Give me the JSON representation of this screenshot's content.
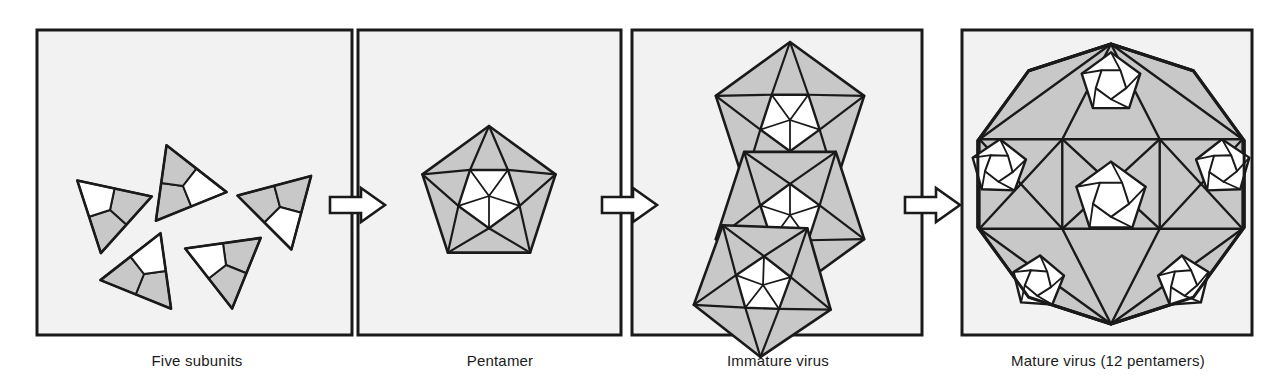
{
  "figure": {
    "background_color": "#ffffff",
    "panel_fill": "#f2f2f2",
    "panel_stroke": "#1a1a1a",
    "shape_fill": "#c8c8c8",
    "shape_white": "#ffffff",
    "shape_stroke": "#1a1a1a",
    "arrow_fill": "#ffffff",
    "arrow_stroke": "#1a1a1a"
  },
  "panels": [
    {
      "id": "five-subunits",
      "label": "Five subunits",
      "label_x": 197,
      "label_y": 352,
      "box": {
        "x": 37,
        "y": 30,
        "w": 315,
        "h": 305
      },
      "content_kind": "scattered-subunits",
      "subunit_count": 5,
      "subunits": [
        {
          "cx": 110,
          "cy": 210,
          "r": 44,
          "rot": -18
        },
        {
          "cx": 183,
          "cy": 186,
          "r": 44,
          "rot": 128
        },
        {
          "cx": 144,
          "cy": 274,
          "r": 44,
          "rot": 52
        },
        {
          "cx": 226,
          "cy": 265,
          "r": 44,
          "rot": -38
        },
        {
          "cx": 280,
          "cy": 207,
          "r": 44,
          "rot": 195
        }
      ]
    },
    {
      "id": "pentamer",
      "label": "Pentamer",
      "label_x": 500,
      "label_y": 352,
      "box": {
        "x": 358,
        "y": 30,
        "w": 263,
        "h": 305
      },
      "content_kind": "single-pentamer",
      "pentamer": {
        "cx": 489,
        "cy": 196,
        "r": 70,
        "rot": -90
      }
    },
    {
      "id": "immature-virus",
      "label": "Immature virus",
      "label_x": 778,
      "label_y": 352,
      "box": {
        "x": 632,
        "y": 30,
        "w": 290,
        "h": 305
      },
      "content_kind": "partial-assembly",
      "pentamer_count": 3,
      "pentamers": [
        {
          "cx": 790,
          "cy": 120,
          "r": 78,
          "rot": -90
        },
        {
          "cx": 790,
          "cy": 215,
          "r": 78,
          "rot": 90
        },
        {
          "cx": 763,
          "cy": 285,
          "r": 72,
          "rot": 20
        }
      ]
    },
    {
      "id": "mature-virus",
      "label": "Mature virus (12 pentamers)",
      "label_x": 1108,
      "label_y": 352,
      "box": {
        "x": 962,
        "y": 30,
        "w": 290,
        "h": 305
      },
      "content_kind": "icosahedral-capsid",
      "pentamer_count": 12,
      "capsid": {
        "cx": 1111,
        "cy": 184,
        "r": 140
      }
    }
  ],
  "arrows": [
    {
      "id": "arrow-1",
      "from": "five-subunits",
      "to": "pentamer",
      "x": 330,
      "y": 205,
      "length": 55,
      "direction": "right"
    },
    {
      "id": "arrow-2",
      "from": "pentamer",
      "to": "immature-virus",
      "x": 602,
      "y": 205,
      "length": 55,
      "direction": "right"
    },
    {
      "id": "arrow-3",
      "from": "immature-virus",
      "to": "mature-virus",
      "x": 905,
      "y": 205,
      "length": 55,
      "direction": "right"
    }
  ]
}
